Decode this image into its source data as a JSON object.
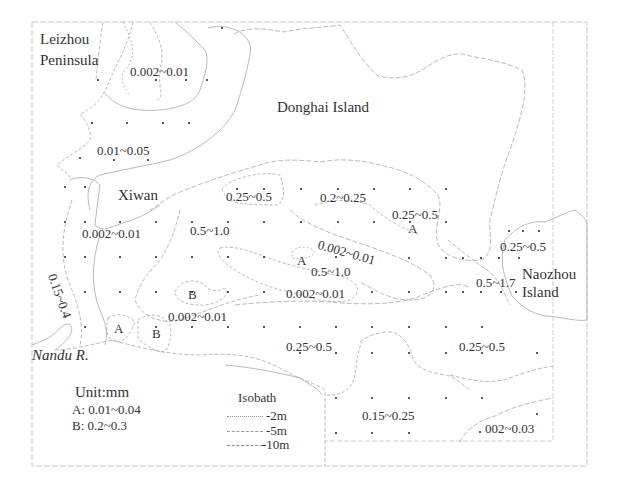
{
  "map": {
    "place_labels": [
      {
        "id": "leizhou",
        "text": "Leizhou",
        "x": 40,
        "y": 32
      },
      {
        "id": "peninsula",
        "text": "Peninsula",
        "x": 40,
        "y": 53
      },
      {
        "id": "donghai",
        "text": "Donghai Island",
        "x": 277,
        "y": 100
      },
      {
        "id": "xiwan",
        "text": "Xiwan",
        "x": 118,
        "y": 188
      },
      {
        "id": "naozhou",
        "text": "Naozhou",
        "x": 522,
        "y": 267
      },
      {
        "id": "naozhou_island",
        "text": "Island",
        "x": 522,
        "y": 285
      }
    ],
    "river_label": {
      "text": "Nandu R.",
      "x": 32,
      "y": 348
    },
    "zone_labels": [
      {
        "text": "0.002~0.01",
        "x": 130,
        "y": 65
      },
      {
        "text": "0.01~0.05",
        "x": 97,
        "y": 144
      },
      {
        "text": "0.25~0.5",
        "x": 226,
        "y": 190
      },
      {
        "text": "0.2~0.25",
        "x": 320,
        "y": 191
      },
      {
        "text": "0.25~0.5",
        "x": 392,
        "y": 208
      },
      {
        "text": "0.002~0.01",
        "x": 82,
        "y": 227
      },
      {
        "text": "0.5~1.0",
        "x": 190,
        "y": 224
      },
      {
        "text": "0.002~0.01",
        "x": 320,
        "y": 238,
        "rotate": 16
      },
      {
        "text": "0.25~0.5",
        "x": 500,
        "y": 240
      },
      {
        "text": "0.5~1.0",
        "x": 311,
        "y": 265
      },
      {
        "text": "0.5~1.7",
        "x": 476,
        "y": 276
      },
      {
        "text": "0.002~0.01",
        "x": 286,
        "y": 287
      },
      {
        "text": "0.002~0.01",
        "x": 168,
        "y": 310
      },
      {
        "text": "0.15~0.4",
        "x": 58,
        "y": 272,
        "rotate": 70
      },
      {
        "text": "0.25~0.5",
        "x": 286,
        "y": 340
      },
      {
        "text": "0.25~0.5",
        "x": 459,
        "y": 340
      },
      {
        "text": "0.15~0.25",
        "x": 362,
        "y": 409
      },
      {
        "text": "002~0.03",
        "x": 485,
        "y": 422
      }
    ],
    "subzone_labels": [
      {
        "text": "A",
        "x": 297,
        "y": 254
      },
      {
        "text": "A",
        "x": 408,
        "y": 222
      },
      {
        "text": "B",
        "x": 188,
        "y": 288
      },
      {
        "text": "A",
        "x": 114,
        "y": 322
      },
      {
        "text": "B",
        "x": 152,
        "y": 327
      }
    ],
    "sample_points": [
      [
        222,
        28
      ],
      [
        98,
        80
      ],
      [
        156,
        80
      ],
      [
        186,
        80
      ],
      [
        207,
        80
      ],
      [
        92,
        123
      ],
      [
        127,
        123
      ],
      [
        163,
        123
      ],
      [
        189,
        123
      ],
      [
        80,
        158
      ],
      [
        114,
        160
      ],
      [
        148,
        160
      ],
      [
        65,
        187
      ],
      [
        85,
        187
      ],
      [
        237,
        189
      ],
      [
        264,
        189
      ],
      [
        301,
        189
      ],
      [
        338,
        189
      ],
      [
        374,
        189
      ],
      [
        410,
        189
      ],
      [
        446,
        189
      ],
      [
        65,
        222
      ],
      [
        85,
        222
      ],
      [
        120,
        222
      ],
      [
        156,
        222
      ],
      [
        192,
        222
      ],
      [
        228,
        222
      ],
      [
        264,
        222
      ],
      [
        301,
        222
      ],
      [
        338,
        222
      ],
      [
        374,
        222
      ],
      [
        410,
        222
      ],
      [
        446,
        222
      ],
      [
        509,
        231
      ],
      [
        523,
        231
      ],
      [
        539,
        231
      ],
      [
        65,
        257
      ],
      [
        85,
        257
      ],
      [
        120,
        257
      ],
      [
        156,
        257
      ],
      [
        192,
        257
      ],
      [
        228,
        257
      ],
      [
        264,
        257
      ],
      [
        336,
        257
      ],
      [
        409,
        258
      ],
      [
        446,
        258
      ],
      [
        463,
        258
      ],
      [
        481,
        258
      ],
      [
        499,
        258
      ],
      [
        519,
        258
      ],
      [
        85,
        292
      ],
      [
        120,
        292
      ],
      [
        156,
        292
      ],
      [
        192,
        292
      ],
      [
        228,
        292
      ],
      [
        264,
        292
      ],
      [
        372,
        292
      ],
      [
        409,
        292
      ],
      [
        446,
        292
      ],
      [
        463,
        292
      ],
      [
        481,
        292
      ],
      [
        501,
        292
      ],
      [
        516,
        292
      ],
      [
        85,
        327
      ],
      [
        156,
        327
      ],
      [
        192,
        327
      ],
      [
        228,
        327
      ],
      [
        264,
        327
      ],
      [
        300,
        327
      ],
      [
        336,
        327
      ],
      [
        372,
        327
      ],
      [
        409,
        327
      ],
      [
        446,
        327
      ],
      [
        482,
        327
      ],
      [
        300,
        353
      ],
      [
        336,
        353
      ],
      [
        372,
        353
      ],
      [
        409,
        353
      ],
      [
        446,
        353
      ],
      [
        482,
        353
      ],
      [
        537,
        353
      ],
      [
        336,
        398
      ],
      [
        372,
        398
      ],
      [
        409,
        398
      ],
      [
        446,
        398
      ],
      [
        482,
        398
      ],
      [
        336,
        433
      ],
      [
        372,
        433
      ],
      [
        409,
        433
      ],
      [
        537,
        414
      ],
      [
        480,
        432
      ]
    ]
  },
  "legend": {
    "unit": "Unit:mm",
    "a_range": "A: 0.01~0.04",
    "b_range": "B: 0.2~0.3",
    "isobath_title": "Isobath",
    "isobath_items": [
      {
        "label": "-2m",
        "style": "dotted"
      },
      {
        "label": "-5m",
        "style": "dashed"
      },
      {
        "label": "-10m",
        "style": "dashdot"
      }
    ]
  },
  "colors": {
    "frame": "#b8b8b8",
    "isoline": "#a8a8a8",
    "text": "#333333",
    "dot": "#222222"
  }
}
